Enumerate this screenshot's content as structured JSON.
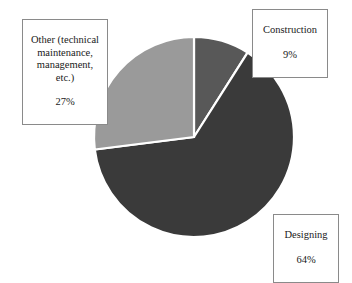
{
  "chart_data": {
    "type": "pie",
    "title": "",
    "subtitle": "",
    "xlabel": "",
    "ylabel": "",
    "legend_position": "none",
    "grid": false,
    "start_angle_deg": 0,
    "direction": "clockwise",
    "categories": [
      "Construction",
      "Designing",
      "Other (technical maintenance, management, etc.)"
    ],
    "values": [
      9,
      64,
      27
    ],
    "value_unit": "%",
    "slice_colors": [
      "#585858",
      "#3a3a3a",
      "#9a9a9a"
    ],
    "slice_border_color": "#ffffff",
    "background_color": "#ffffff",
    "slices": [
      {
        "name": "Construction",
        "value": 9,
        "value_label": "9%",
        "color": "#585858",
        "start_deg": 0,
        "end_deg": 32.4
      },
      {
        "name": "Designing",
        "value": 64,
        "value_label": "64%",
        "color": "#3a3a3a",
        "start_deg": 32.4,
        "end_deg": 262.8
      },
      {
        "name": "Other (technical maintenance, management, etc.)",
        "value": 27,
        "value_label": "27%",
        "color": "#9a9a9a",
        "start_deg": 262.8,
        "end_deg": 360
      }
    ]
  },
  "labels": {
    "other": {
      "name": "Other (technical\nmaintenance,\nmanagement,\netc.)",
      "value": "27%"
    },
    "construction": {
      "name": "Construction",
      "value": "9%"
    },
    "designing": {
      "name": "Designing",
      "value": "64%"
    }
  },
  "geometry": {
    "center_x": 194,
    "center_y": 137,
    "radius": 100
  }
}
